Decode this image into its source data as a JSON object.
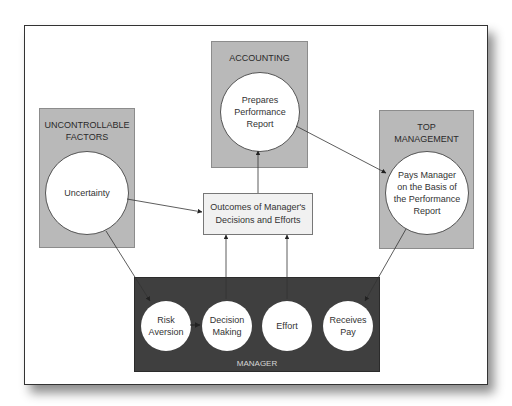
{
  "diagram": {
    "accounting": {
      "title": "ACCOUNTING",
      "circle_lines": [
        "Prepares",
        "Performance",
        "Report"
      ]
    },
    "uncontrollable_factors": {
      "title_lines": [
        "UNCONTROLLABLE",
        "FACTORS"
      ],
      "circle": "Uncertainty"
    },
    "top_management": {
      "title_lines": [
        "TOP",
        "MANAGEMENT"
      ],
      "circle_lines": [
        "Pays Manager",
        "on the Basis of",
        "the Performance",
        "Report"
      ]
    },
    "outcomes": {
      "lines": [
        "Outcomes of Manager's",
        "Decisions and Efforts"
      ]
    },
    "manager": {
      "label": "MANAGER",
      "circles": [
        {
          "lines": [
            "Risk",
            "Aversion"
          ]
        },
        {
          "lines": [
            "Decision",
            "Making"
          ]
        },
        {
          "lines": [
            "Effort"
          ]
        },
        {
          "lines": [
            "Receives",
            "Pay"
          ]
        }
      ]
    },
    "colors": {
      "gray_box": "#b9b9b9",
      "manager_box": "#3f3f3f",
      "outcomes_box": "#f1f1f1",
      "circle": "#ffffff"
    },
    "arrows": [
      {
        "from": "Uncertainty",
        "to": "Outcomes of Manager's Decisions and Efforts"
      },
      {
        "from": "Uncertainty",
        "to": "Risk Aversion"
      },
      {
        "from": "Risk Aversion",
        "to": "Decision Making"
      },
      {
        "from": "Decision Making",
        "to": "Outcomes of Manager's Decisions and Efforts"
      },
      {
        "from": "Effort",
        "to": "Outcomes of Manager's Decisions and Efforts"
      },
      {
        "from": "Outcomes of Manager's Decisions and Efforts",
        "to": "Prepares Performance Report"
      },
      {
        "from": "Prepares Performance Report",
        "to": "Pays Manager on the Basis of the Performance Report"
      },
      {
        "from": "Pays Manager on the Basis of the Performance Report",
        "to": "Receives Pay"
      }
    ]
  }
}
